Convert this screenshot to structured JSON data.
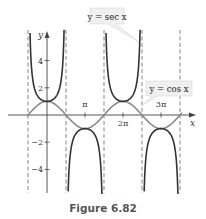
{
  "caption": "Figure 6.82",
  "chart_data": {
    "type": "line",
    "title": "",
    "xlabel": "x",
    "ylabel": "y",
    "xlim": [
      -1.7,
      4.1
    ],
    "ylim": [
      -5.9,
      6.4
    ],
    "x_unit": "pi",
    "x_ticks": [
      {
        "value": 1,
        "label": "π"
      },
      {
        "value": 2,
        "label": "2π"
      },
      {
        "value": 3,
        "label": "3π"
      }
    ],
    "y_ticks": [
      {
        "value": 4,
        "label": "4"
      },
      {
        "value": 2,
        "label": "2"
      },
      {
        "value": -2,
        "label": "−2"
      },
      {
        "value": -4,
        "label": "−4"
      }
    ],
    "asymptotes_x_pi": [
      -0.5,
      0.5,
      1.5,
      2.5,
      3.5
    ],
    "series": [
      {
        "name": "y = sec x",
        "function": "sec",
        "color": "#333333",
        "label": "y = sec x"
      },
      {
        "name": "y = cos x",
        "function": "cos",
        "color": "#8a8a8a",
        "label": "y = cos x"
      }
    ],
    "annotations": [
      {
        "text": "y = sec x",
        "points_to": "sec x near x = 5π/2"
      },
      {
        "text": "y = cos x",
        "points_to": "cos x near x = 5π/2"
      }
    ],
    "grid": false
  }
}
